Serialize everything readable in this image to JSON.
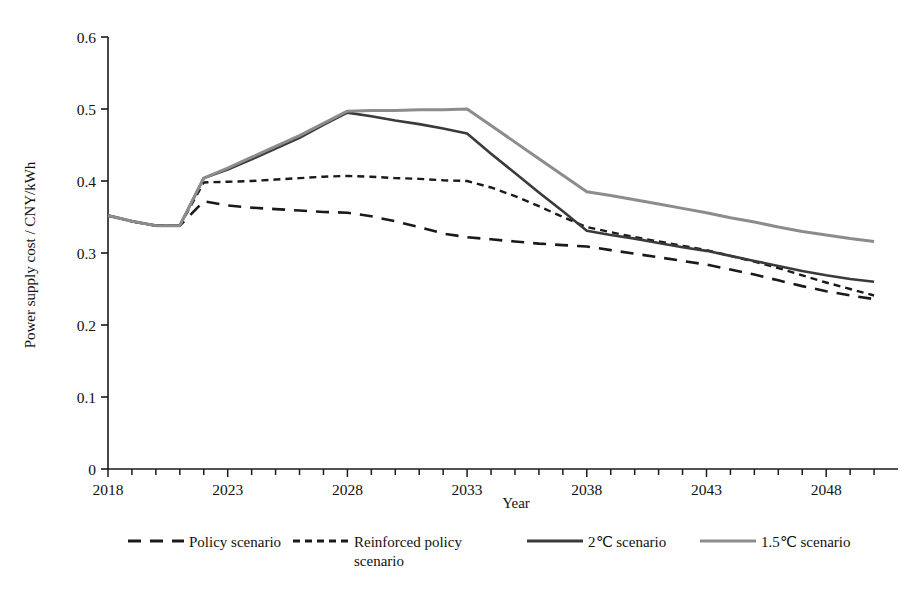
{
  "chart_data": {
    "type": "line",
    "title": "",
    "xlabel": "Year",
    "ylabel": "Power supply cost / CNY/kWh",
    "xlim": [
      2018,
      2051
    ],
    "ylim": [
      0,
      0.6
    ],
    "ytick_labels": [
      "0",
      "0.1",
      "0.2",
      "0.3",
      "0.4",
      "0.5",
      "0.6"
    ],
    "ytick_values": [
      0,
      0.1,
      0.2,
      0.3,
      0.4,
      0.5,
      0.6
    ],
    "xtick_labels": [
      "2018",
      "2023",
      "2028",
      "2033",
      "2038",
      "2043",
      "2048"
    ],
    "xtick_values": [
      2018,
      2023,
      2028,
      2033,
      2038,
      2043,
      2048
    ],
    "minor_xtick_step": 1,
    "grid": false,
    "legend_position": "bottom",
    "x": [
      2018,
      2019,
      2020,
      2021,
      2022,
      2023,
      2024,
      2025,
      2026,
      2027,
      2028,
      2029,
      2030,
      2031,
      2032,
      2033,
      2034,
      2035,
      2036,
      2037,
      2038,
      2039,
      2040,
      2041,
      2042,
      2043,
      2044,
      2045,
      2046,
      2047,
      2048,
      2049,
      2050
    ],
    "series": [
      {
        "name": "Policy scenario",
        "color": "#1a1a1a",
        "style": "long-dash",
        "width": 2.6,
        "values": [
          0.352,
          0.344,
          0.338,
          0.338,
          0.372,
          0.366,
          0.363,
          0.361,
          0.359,
          0.357,
          0.356,
          0.351,
          0.344,
          0.336,
          0.327,
          0.322,
          0.319,
          0.316,
          0.313,
          0.311,
          0.309,
          0.304,
          0.299,
          0.294,
          0.289,
          0.284,
          0.277,
          0.27,
          0.262,
          0.254,
          0.247,
          0.241,
          0.236
        ]
      },
      {
        "name": "Reinforced policy scenario",
        "color": "#1a1a1a",
        "style": "short-dash",
        "width": 2.4,
        "values": [
          0.352,
          0.344,
          0.338,
          0.338,
          0.398,
          0.399,
          0.4,
          0.402,
          0.404,
          0.406,
          0.407,
          0.406,
          0.404,
          0.403,
          0.401,
          0.4,
          0.391,
          0.379,
          0.365,
          0.35,
          0.336,
          0.329,
          0.322,
          0.316,
          0.31,
          0.304,
          0.296,
          0.288,
          0.279,
          0.269,
          0.259,
          0.25,
          0.241
        ]
      },
      {
        "name": "2℃ scenario",
        "color": "#3a3a3a",
        "style": "solid",
        "width": 2.6,
        "values": [
          0.352,
          0.344,
          0.338,
          0.338,
          0.404,
          0.416,
          0.43,
          0.445,
          0.46,
          0.478,
          0.495,
          0.49,
          0.484,
          0.479,
          0.473,
          0.466,
          0.438,
          0.411,
          0.384,
          0.358,
          0.331,
          0.325,
          0.32,
          0.314,
          0.308,
          0.303,
          0.296,
          0.289,
          0.282,
          0.275,
          0.269,
          0.264,
          0.26
        ]
      },
      {
        "name": "1.5℃ scenario",
        "color": "#8c8c8c",
        "style": "solid",
        "width": 3.0,
        "values": [
          0.352,
          0.344,
          0.338,
          0.338,
          0.404,
          0.418,
          0.433,
          0.448,
          0.463,
          0.48,
          0.497,
          0.498,
          0.498,
          0.499,
          0.499,
          0.5,
          0.477,
          0.454,
          0.431,
          0.408,
          0.385,
          0.38,
          0.374,
          0.368,
          0.362,
          0.356,
          0.349,
          0.343,
          0.336,
          0.33,
          0.325,
          0.32,
          0.316
        ]
      }
    ]
  },
  "legend": {
    "items": [
      {
        "label": "Policy scenario",
        "style": "long-dash",
        "color": "#1a1a1a"
      },
      {
        "label": "Reinforced policy",
        "label2": "scenario",
        "style": "short-dash",
        "color": "#1a1a1a"
      },
      {
        "label": "2℃ scenario",
        "style": "solid",
        "color": "#3a3a3a"
      },
      {
        "label": "1.5℃ scenario",
        "style": "solid",
        "color": "#8c8c8c"
      }
    ]
  }
}
